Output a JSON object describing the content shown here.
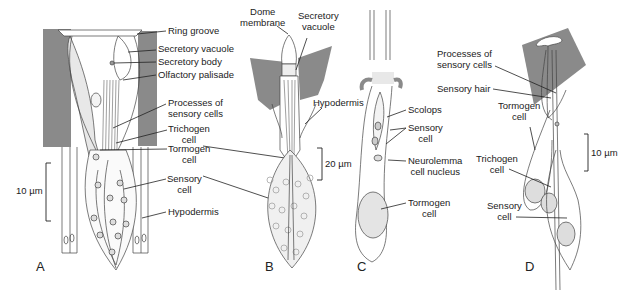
{
  "figure": {
    "panels": [
      {
        "id": "A",
        "scale_bar": "10 µm",
        "labels": [
          "Ring groove",
          "Secretory vacuole",
          "Secretory body",
          "Olfactory palisade",
          "Processes of sensory cells",
          "Trichogen cell",
          "Tormogen cell",
          "Sensory cell",
          "Hypodermis"
        ]
      },
      {
        "id": "B",
        "scale_bar": "20 µm",
        "labels": [
          "Dome membrane",
          "Secretory vacuole",
          "Hypodermis"
        ]
      },
      {
        "id": "C",
        "labels": [
          "Scolops",
          "Sensory cell",
          "Neurolemma cell nucleus",
          "Tormogen cell"
        ]
      },
      {
        "id": "D",
        "scale_bar": "10 µm",
        "labels": [
          "Processes of sensory cells",
          "Sensory hair",
          "Tormogen cell",
          "Trichogen cell",
          "Sensory cell"
        ]
      }
    ]
  },
  "labels": {
    "ring_groove": "Ring groove",
    "secretory_vacuole_a": "Secretory vacuole",
    "secretory_body": "Secretory body",
    "olfactory_palisade": "Olfactory palisade",
    "processes_a_1": "Processes of",
    "processes_a_2": "sensory cells",
    "trichogen_a_1": "Trichogen",
    "trichogen_a_2": "cell",
    "tormogen_a_1": "Tormogen",
    "tormogen_a_2": "cell",
    "sensory_a_1": "Sensory",
    "sensory_a_2": "cell",
    "hypodermis_a": "Hypodermis",
    "scale_a": "10 µm",
    "panel_a": "A",
    "dome_1": "Dome",
    "dome_2": "membrane",
    "secretory_vacuole_b_1": "Secretory",
    "secretory_vacuole_b_2": "vacuole",
    "hypodermis_b": "Hypodermis",
    "scale_b": "20 µm",
    "panel_b": "B",
    "scolops": "Scolops",
    "sensory_c_1": "Sensory",
    "sensory_c_2": "cell",
    "neurolemma_1": "Neurolemma",
    "neurolemma_2": "cell nucleus",
    "tormogen_c_1": "Tormogen",
    "tormogen_c_2": "cell",
    "panel_c": "C",
    "processes_d_1": "Processes of",
    "processes_d_2": "sensory cells",
    "sensory_hair": "Sensory hair",
    "tormogen_d_1": "Tormogen",
    "tormogen_d_2": "cell",
    "trichogen_d_1": "Trichogen",
    "trichogen_d_2": "cell",
    "sensory_d_1": "Sensory",
    "sensory_d_2": "cell",
    "scale_d": "10 µm",
    "panel_d": "D"
  },
  "colors": {
    "cuticle": "#8a8a8a",
    "line": "#333333",
    "stipple": "#e4e4e4"
  }
}
